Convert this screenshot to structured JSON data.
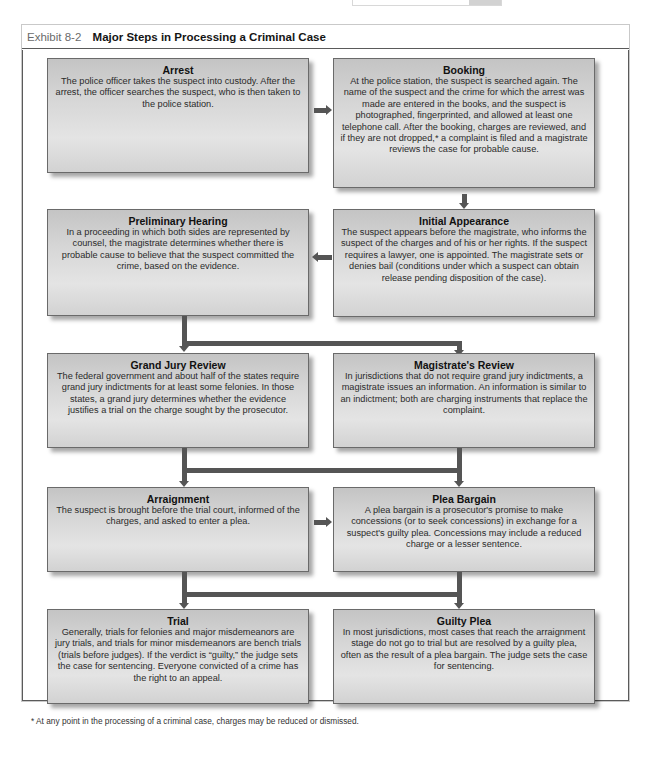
{
  "exhibit": {
    "number": "Exhibit 8-2",
    "title": "Major Steps in Processing a Criminal Case"
  },
  "steps": [
    {
      "title": "Arrest",
      "description": "The police officer takes the suspect into custody. After the arrest, the officer searches the suspect, who is then taken to the police station."
    },
    {
      "title": "Booking",
      "description": "At the police station, the suspect is searched again. The name of the suspect and the crime for which the arrest was made are entered in the books, and the suspect is photographed, fingerprinted, and allowed at least one telephone call. After the booking, charges are reviewed, and if they are not dropped,* a complaint is filed and a magistrate reviews the case for probable cause."
    },
    {
      "title": "Preliminary Hearing",
      "description": "In a proceeding in which both sides are represented by counsel, the magistrate determines whether there is probable cause to believe that the suspect committed the crime, based on the evidence."
    },
    {
      "title": "Initial Appearance",
      "description": "The suspect appears before the magistrate, who informs the suspect of the charges and of his or her rights. If the suspect requires a lawyer, one is appointed. The magistrate sets or denies bail (conditions under which a suspect can obtain release pending disposition of the case)."
    },
    {
      "title": "Grand Jury Review",
      "description": "The federal government and about half of the states require grand jury indictments for at least some felonies. In those states, a grand jury determines whether the evidence justifies a trial on the charge sought by the prosecutor."
    },
    {
      "title": "Magistrate's Review",
      "description": "In jurisdictions that do not require grand jury indictments, a magistrate issues an information. An information is similar to an indictment; both are charging instruments that replace the complaint."
    },
    {
      "title": "Arraignment",
      "description": "The suspect is brought before the trial court, informed of the charges, and asked to enter a plea."
    },
    {
      "title": "Plea Bargain",
      "description": "A plea bargain is a prosecutor's promise to make concessions (or to seek concessions) in exchange for a suspect's guilty plea. Concessions may include a reduced charge or a lesser sentence."
    },
    {
      "title": "Trial",
      "description": "Generally, trials for felonies and major misdemeanors are jury trials, and trials for minor misdemeanors are bench trials (trials before judges). If the verdict is “guilty,” the judge sets the case for sentencing. Everyone convicted of a crime has the right to an appeal."
    },
    {
      "title": "Guilty Plea",
      "description": "In most jurisdictions, most cases that reach the arraignment stage do not go to trial but are resolved by a guilty plea, often as the result of a plea bargain. The judge sets the case for sentencing."
    }
  ],
  "flow": [
    {
      "from": "Arrest",
      "to": "Booking",
      "direction": "right"
    },
    {
      "from": "Booking",
      "to": "Initial Appearance",
      "direction": "down"
    },
    {
      "from": "Initial Appearance",
      "to": "Preliminary Hearing",
      "direction": "left"
    },
    {
      "from": "Preliminary Hearing",
      "to": [
        "Grand Jury Review",
        "Magistrate's Review"
      ],
      "direction": "split-down"
    },
    {
      "from": [
        "Grand Jury Review",
        "Magistrate's Review"
      ],
      "to": "Arraignment",
      "direction": "merge-down"
    },
    {
      "from": "Arraignment",
      "to": "Plea Bargain",
      "direction": "right"
    },
    {
      "from": [
        "Arraignment",
        "Plea Bargain"
      ],
      "to": [
        "Trial",
        "Guilty Plea"
      ],
      "direction": "split-down"
    }
  ],
  "footnote": "* At any point in the processing of a criminal case, charges may be reduced or dismissed.",
  "colors": {
    "box_fill": "#d6d6d6",
    "box_border": "#6a6a6a",
    "arrow": "#555555",
    "frame_border": "#5a5a5a",
    "exhibit_number": "#6b6b6b"
  }
}
